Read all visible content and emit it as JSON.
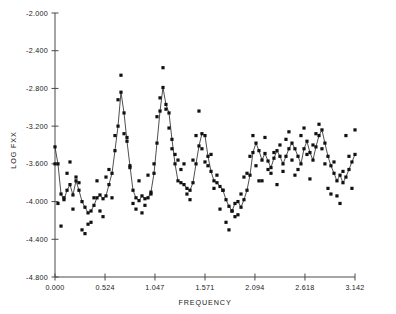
{
  "chart_data": {
    "type": "line",
    "title": "",
    "xlabel": "FREQUENCY",
    "ylabel": "LOG FXX",
    "xlim": [
      0.0,
      3.142
    ],
    "ylim": [
      -4.8,
      -2.0
    ],
    "grid": false,
    "legend": "none",
    "xticks": [
      "0.000",
      "0.524",
      "1.047",
      "1.571",
      "2.094",
      "2.618",
      "3.142"
    ],
    "xtick_values": [
      0.0,
      0.524,
      1.047,
      1.571,
      2.094,
      2.618,
      3.142
    ],
    "yticks": [
      "-2.000",
      "-2.400",
      "-2.800",
      "-3.200",
      "-3.600",
      "-4.000",
      "-4.400",
      "-4.800"
    ],
    "ytick_values": [
      -2.0,
      -2.4,
      -2.8,
      -3.2,
      -3.6,
      -4.0,
      -4.4,
      -4.8
    ],
    "series": [
      {
        "name": "smoothed spectrum",
        "marker": "square",
        "line": true,
        "x": [
          0.0,
          0.031,
          0.063,
          0.094,
          0.126,
          0.157,
          0.188,
          0.22,
          0.251,
          0.283,
          0.314,
          0.346,
          0.377,
          0.408,
          0.44,
          0.471,
          0.503,
          0.534,
          0.565,
          0.597,
          0.628,
          0.66,
          0.691,
          0.723,
          0.754,
          0.785,
          0.817,
          0.848,
          0.88,
          0.911,
          0.942,
          0.974,
          1.005,
          1.037,
          1.068,
          1.1,
          1.131,
          1.162,
          1.194,
          1.225,
          1.257,
          1.288,
          1.319,
          1.351,
          1.382,
          1.414,
          1.445,
          1.477,
          1.508,
          1.539,
          1.571,
          1.602,
          1.634,
          1.665,
          1.696,
          1.728,
          1.759,
          1.791,
          1.822,
          1.854,
          1.885,
          1.916,
          1.948,
          1.979,
          2.011,
          2.042,
          2.073,
          2.105,
          2.136,
          2.168,
          2.199,
          2.231,
          2.262,
          2.293,
          2.325,
          2.356,
          2.388,
          2.419,
          2.45,
          2.482,
          2.513,
          2.545,
          2.576,
          2.608,
          2.639,
          2.67,
          2.702,
          2.733,
          2.765,
          2.796,
          2.827,
          2.859,
          2.89,
          2.922,
          2.953,
          2.985,
          3.016,
          3.047,
          3.079,
          3.11,
          3.142
        ],
        "y": [
          -3.42,
          -3.6,
          -3.92,
          -3.98,
          -3.88,
          -3.82,
          -3.93,
          -3.78,
          -3.88,
          -4.0,
          -4.06,
          -4.12,
          -4.1,
          -4.04,
          -3.96,
          -3.93,
          -3.97,
          -3.94,
          -3.82,
          -3.7,
          -3.46,
          -3.2,
          -2.84,
          -3.06,
          -3.36,
          -3.62,
          -3.88,
          -3.96,
          -3.99,
          -3.94,
          -3.97,
          -3.96,
          -3.9,
          -3.7,
          -3.38,
          -3.04,
          -2.79,
          -2.97,
          -3.06,
          -3.34,
          -3.6,
          -3.78,
          -3.8,
          -3.82,
          -3.86,
          -3.88,
          -3.8,
          -3.6,
          -3.41,
          -3.28,
          -3.3,
          -3.52,
          -3.68,
          -3.78,
          -3.8,
          -3.84,
          -3.88,
          -3.98,
          -4.05,
          -4.1,
          -4.02,
          -4.0,
          -4.06,
          -3.98,
          -3.88,
          -3.72,
          -3.48,
          -3.38,
          -3.46,
          -3.56,
          -3.49,
          -3.57,
          -3.64,
          -3.54,
          -3.46,
          -3.52,
          -3.6,
          -3.52,
          -3.44,
          -3.38,
          -3.44,
          -3.52,
          -3.6,
          -3.44,
          -3.36,
          -3.48,
          -3.56,
          -3.42,
          -3.3,
          -3.24,
          -3.38,
          -3.52,
          -3.62,
          -3.7,
          -3.78,
          -3.72,
          -3.8,
          -3.74,
          -3.66,
          -3.58,
          -3.5
        ]
      },
      {
        "name": "periodogram",
        "marker": "square",
        "line": false,
        "x": [
          0.0,
          0.031,
          0.063,
          0.094,
          0.126,
          0.157,
          0.188,
          0.22,
          0.251,
          0.283,
          0.314,
          0.346,
          0.377,
          0.408,
          0.44,
          0.471,
          0.503,
          0.534,
          0.565,
          0.597,
          0.628,
          0.66,
          0.691,
          0.723,
          0.754,
          0.785,
          0.817,
          0.848,
          0.88,
          0.911,
          0.942,
          0.974,
          1.005,
          1.037,
          1.068,
          1.1,
          1.131,
          1.162,
          1.194,
          1.225,
          1.257,
          1.288,
          1.319,
          1.351,
          1.382,
          1.414,
          1.445,
          1.477,
          1.508,
          1.539,
          1.571,
          1.602,
          1.634,
          1.665,
          1.696,
          1.728,
          1.759,
          1.791,
          1.822,
          1.854,
          1.885,
          1.916,
          1.948,
          1.979,
          2.011,
          2.042,
          2.073,
          2.105,
          2.136,
          2.168,
          2.199,
          2.231,
          2.262,
          2.293,
          2.325,
          2.356,
          2.388,
          2.419,
          2.45,
          2.482,
          2.513,
          2.545,
          2.576,
          2.608,
          2.639,
          2.67,
          2.702,
          2.733,
          2.765,
          2.796,
          2.827,
          2.859,
          2.89,
          2.922,
          2.953,
          2.985,
          3.016,
          3.047,
          3.079,
          3.11,
          3.142
        ],
        "y": [
          -3.6,
          -4.02,
          -4.26,
          -3.96,
          -3.7,
          -3.58,
          -4.08,
          -3.74,
          -3.8,
          -4.3,
          -4.34,
          -4.24,
          -4.22,
          -3.96,
          -3.78,
          -4.1,
          -4.16,
          -3.74,
          -3.66,
          -3.96,
          -3.3,
          -2.92,
          -2.66,
          -3.28,
          -3.32,
          -3.64,
          -4.02,
          -4.08,
          -3.78,
          -4.12,
          -4.04,
          -3.72,
          -3.92,
          -3.6,
          -3.1,
          -2.9,
          -2.58,
          -3.02,
          -3.22,
          -3.44,
          -3.5,
          -3.56,
          -3.66,
          -3.6,
          -3.92,
          -3.98,
          -3.56,
          -3.3,
          -3.04,
          -3.44,
          -3.58,
          -3.62,
          -3.5,
          -3.86,
          -3.72,
          -4.08,
          -3.88,
          -4.22,
          -4.3,
          -4.1,
          -4.16,
          -4.14,
          -3.92,
          -3.74,
          -3.7,
          -3.52,
          -3.3,
          -3.62,
          -3.78,
          -3.78,
          -3.32,
          -3.66,
          -3.7,
          -3.48,
          -3.82,
          -3.4,
          -3.68,
          -3.34,
          -3.26,
          -3.56,
          -3.72,
          -3.66,
          -3.3,
          -3.22,
          -3.5,
          -3.76,
          -3.4,
          -3.28,
          -3.18,
          -3.44,
          -3.6,
          -3.86,
          -3.92,
          -3.58,
          -3.94,
          -4.02,
          -3.68,
          -3.3,
          -3.52,
          -3.86,
          -3.24
        ]
      }
    ]
  },
  "axes": {
    "x_title": "FREQUENCY",
    "y_title": "LOG FXX"
  }
}
